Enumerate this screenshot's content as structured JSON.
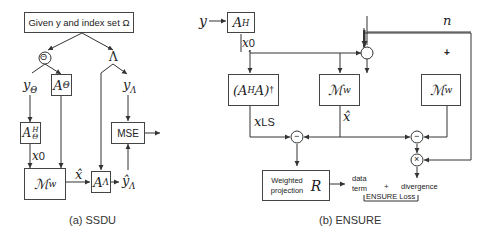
{
  "ssdu": {
    "caption": "(a) SSDU",
    "top_box": "Given y and index set Ω",
    "theta_node": "Θ",
    "lambda_node": "Λ",
    "y_theta": "yΘ",
    "a_theta_box": "AΘ",
    "y_lambda": "yΛ",
    "a_theta_h_box": "AΘH",
    "x0_label": "x0",
    "mw_box": "ℳw",
    "xhat_label": "x̂",
    "a_lambda_box": "AΛ",
    "yhat_lambda_label": "ŷΛ",
    "mse_box": "MSE"
  },
  "ensure": {
    "caption": "(b) ENSURE",
    "y_input": "y",
    "ah_box": "AH",
    "x0_label": "x0",
    "n_input": "n",
    "plus_node": "+",
    "pinv_box": "(AHA)†",
    "mw_center_box": "ℳw",
    "mw_right_box": "ℳw",
    "xls_label": "xLS",
    "xhat_label": "x̂",
    "minus_left": "−",
    "minus_right": "−",
    "times_node": "×",
    "weighted_box_text_1": "Weighted",
    "weighted_box_text_2": "projection",
    "weighted_box_symbol": "R",
    "data_term_1": "data",
    "data_term_2": "term",
    "plus_sign": "+",
    "divergence": "divergence",
    "loss_label": "ENSURE Loss"
  }
}
